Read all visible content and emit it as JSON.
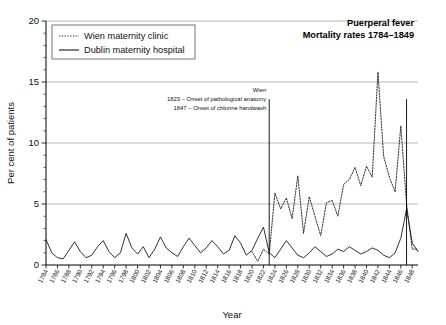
{
  "chart_data": {
    "type": "line",
    "title": "Puerperal fever",
    "subtitle": "Mortality rates 1784–1849",
    "xlabel": "Year",
    "ylabel": "Per cent of patients",
    "xlim": [
      1784,
      1849
    ],
    "ylim": [
      0,
      20
    ],
    "y_ticks": [
      0,
      5,
      10,
      15,
      20
    ],
    "y_tick_labels": [
      "0",
      "5",
      "10",
      "15",
      "20"
    ],
    "y_minor_step": 1,
    "x_tick_step": 2,
    "grid": "horizontal",
    "legend_position": "top-left",
    "x_tick_labels": [
      "1784",
      "1786",
      "1788",
      "1790",
      "1792",
      "1794",
      "1796",
      "1798",
      "1800",
      "1802",
      "1804",
      "1806",
      "1808",
      "1810",
      "1812",
      "1814",
      "1816",
      "1818",
      "1820",
      "1822",
      "1824",
      "1826",
      "1828",
      "1830",
      "1832",
      "1834",
      "1836",
      "1838",
      "1840",
      "1842",
      "1844",
      "1846",
      "1848"
    ],
    "annotations": [
      {
        "name": "wien-label",
        "text": "Wien"
      },
      {
        "name": "event-1823",
        "text": "1823 – Onset of pathological anatomy",
        "year": 1823
      },
      {
        "name": "event-1847",
        "text": "1847 – Onset of chlorine handwash",
        "year": 1847
      }
    ],
    "event_lines": [
      {
        "year": 1823,
        "y_top": 13.6
      },
      {
        "year": 1847,
        "y_top": 13.6
      }
    ],
    "series": [
      {
        "name": "Wien maternity clinic",
        "style": "dotted",
        "x": [
          1820,
          1821,
          1822,
          1823,
          1824,
          1825,
          1826,
          1827,
          1828,
          1829,
          1830,
          1831,
          1832,
          1833,
          1834,
          1835,
          1836,
          1837,
          1838,
          1839,
          1840,
          1841,
          1842,
          1843,
          1844,
          1845,
          1846,
          1847,
          1848,
          1849
        ],
        "values": [
          1.1,
          0.3,
          1.3,
          0.9,
          5.9,
          4.6,
          5.5,
          3.8,
          7.3,
          2.6,
          5.6,
          4.0,
          2.4,
          5.1,
          5.3,
          4.0,
          6.6,
          7.0,
          8.0,
          6.5,
          8.1,
          7.2,
          15.8,
          8.9,
          7.2,
          6.0,
          11.4,
          5.0,
          1.3,
          1.3
        ]
      },
      {
        "name": "Dublin maternity hospital",
        "style": "solid",
        "x": [
          1784,
          1785,
          1786,
          1787,
          1788,
          1789,
          1790,
          1791,
          1792,
          1793,
          1794,
          1795,
          1796,
          1797,
          1798,
          1799,
          1800,
          1801,
          1802,
          1803,
          1804,
          1805,
          1806,
          1807,
          1808,
          1809,
          1810,
          1811,
          1812,
          1813,
          1814,
          1815,
          1816,
          1817,
          1818,
          1819,
          1820,
          1821,
          1822,
          1823,
          1824,
          1825,
          1826,
          1827,
          1828,
          1829,
          1830,
          1831,
          1832,
          1833,
          1834,
          1835,
          1836,
          1837,
          1838,
          1839,
          1840,
          1841,
          1842,
          1843,
          1844,
          1845,
          1846,
          1847,
          1848,
          1849
        ],
        "values": [
          2.1,
          1.0,
          0.6,
          0.5,
          1.2,
          1.9,
          1.1,
          0.6,
          0.8,
          1.5,
          2.0,
          1.1,
          0.6,
          1.0,
          2.6,
          1.4,
          0.9,
          1.5,
          0.6,
          1.3,
          2.3,
          1.4,
          1.0,
          0.7,
          1.5,
          2.2,
          1.6,
          1.0,
          1.4,
          2.0,
          1.5,
          0.9,
          1.2,
          2.4,
          1.8,
          0.8,
          1.2,
          2.2,
          3.1,
          1.0,
          0.6,
          1.3,
          2.0,
          1.4,
          0.8,
          0.6,
          1.0,
          1.5,
          1.1,
          0.7,
          0.9,
          1.3,
          1.1,
          1.5,
          1.2,
          0.9,
          1.1,
          1.4,
          1.2,
          0.8,
          0.6,
          1.0,
          2.2,
          4.6,
          1.8,
          1.1
        ]
      }
    ]
  },
  "legend": {
    "items": [
      {
        "label": "Wien maternity clinic",
        "style": "dotted"
      },
      {
        "label": "Dublin maternity hospital",
        "style": "solid"
      }
    ]
  }
}
